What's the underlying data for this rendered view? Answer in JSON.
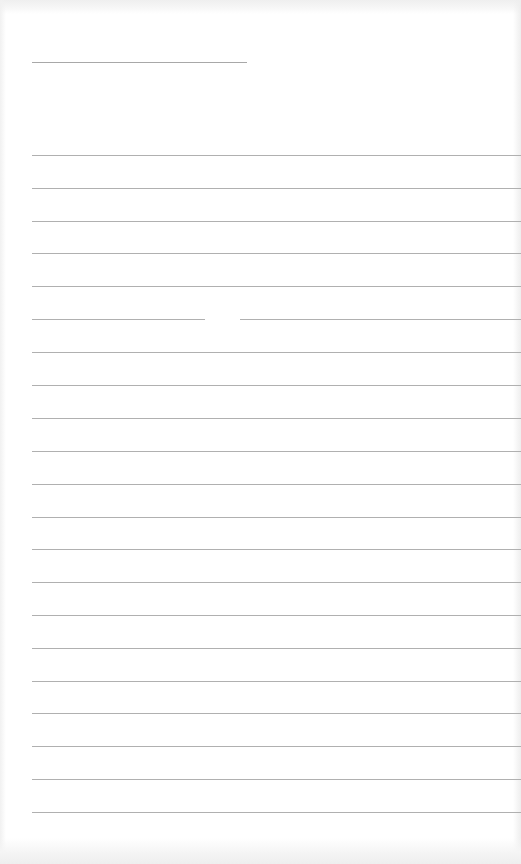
{
  "document": {
    "type": "blank lined page",
    "header_line": {
      "x": 32,
      "y": 62,
      "width": 215
    },
    "ruled_lines": {
      "count": 21,
      "left": 32,
      "positions": [
        155,
        188,
        221,
        253,
        286,
        319,
        352,
        385,
        418,
        451,
        484,
        517,
        549,
        582,
        615,
        648,
        681,
        713,
        746,
        779,
        812
      ],
      "spacing": 33,
      "broken_line_index": 5
    },
    "line_color": "#b0b0b0",
    "paper_color": "#ffffff",
    "text": []
  }
}
